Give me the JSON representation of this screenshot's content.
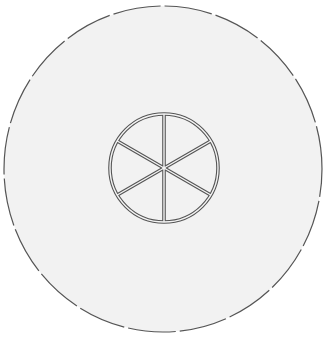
{
  "diagram": {
    "title": "Round table top view with six-spoke center wheel",
    "colors": {
      "background": "#ffffff",
      "fill": "#f2f2f2",
      "stroke": "#555555",
      "inner_gap": "#f4f4f4"
    },
    "outer_circle": {
      "cx": 163,
      "cy": 169,
      "rx": 159,
      "ry": 163,
      "style": "long-dash",
      "dasharray": "48 4"
    },
    "inner_wheel": {
      "cx": 164,
      "cy": 168,
      "r": 54,
      "style": "double-line",
      "spoke_count": 6,
      "spoke_angles_deg": [
        90,
        30,
        -30,
        -90,
        -150,
        150
      ]
    }
  }
}
